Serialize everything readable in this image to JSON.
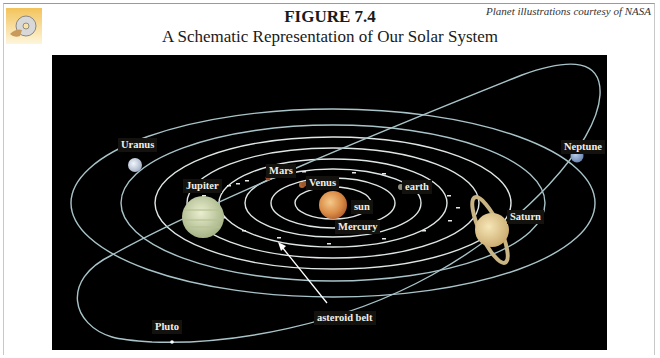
{
  "header": {
    "figure_number": "FIGURE 7.4",
    "title": "A Schematic Representation of Our Solar System",
    "credit": "Planet illustrations courtesy of NASA",
    "icon": "cd-disc-icon"
  },
  "diagram": {
    "background": "#000000",
    "orbit_color": "#a8c4c8",
    "labels": {
      "uranus": "Uranus",
      "jupiter": "Jupiter",
      "mars": "Mars",
      "venus": "Venus",
      "earth": "earth",
      "sun": "sun",
      "mercury": "Mercury",
      "saturn": "Saturn",
      "neptune": "Neptune",
      "pluto": "Pluto",
      "asteroid_belt": "asteroid belt"
    }
  }
}
